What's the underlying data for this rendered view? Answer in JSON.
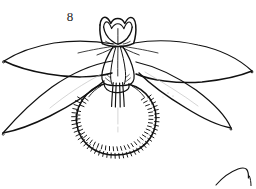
{
  "plate": {
    "background_color": "#ffffff",
    "ink_color": "#111111",
    "faint_ink_color": "#b9b9b9",
    "width": 256,
    "height": 189,
    "figure_number": "8",
    "subject": "orchid-flower-line-drawing",
    "caption_present": false
  },
  "figure": {
    "label": "8",
    "title": "",
    "parts": [
      {
        "name": "dorsal-sepal",
        "label": ""
      },
      {
        "name": "upper-left-petal",
        "label": ""
      },
      {
        "name": "upper-right-petal",
        "label": ""
      },
      {
        "name": "lower-left-petal",
        "label": ""
      },
      {
        "name": "lower-right-petal",
        "label": ""
      },
      {
        "name": "lateral-sepal-column",
        "label": ""
      },
      {
        "name": "hairy-pouch-labellum",
        "label": ""
      }
    ]
  },
  "adjacent_figure": {
    "name": "partial-figure-bottom-right",
    "label": ""
  }
}
